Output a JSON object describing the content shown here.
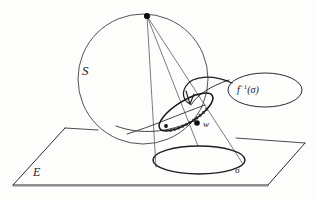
{
  "figure": {
    "stroke_color": "#2a2a2a",
    "fill_color": "#111111",
    "background_color": "#fdfdfc"
  },
  "labels": {
    "sphere": "S",
    "plane": "E",
    "point_w": "w",
    "image_curve": "σ",
    "preimage_curve_f": "f",
    "preimage_curve_exp": "−1",
    "preimage_curve_arg": "(σ)",
    "preimage_curve_full": "f⁻¹(σ)"
  },
  "geometry": {
    "sphere": {
      "cx": 143,
      "cy": 79,
      "r": 65
    },
    "apex_point": {
      "x": 147,
      "y": 16,
      "r": 3.1
    },
    "point_w": {
      "x": 197,
      "y": 123,
      "r": 2.8
    },
    "sigma_ellipse": {
      "cx": 199,
      "cy": 160,
      "rx": 46,
      "ry": 14
    },
    "preimage_ellipse": {
      "cx": 186,
      "cy": 112,
      "rx": 31,
      "ry": 11,
      "rotation": -32
    },
    "callout_ellipse": {
      "cx": 265,
      "cy": 90,
      "rx": 37,
      "ry": 17
    },
    "plane_corners": [
      {
        "x": 13,
        "y": 185
      },
      {
        "x": 65,
        "y": 128
      },
      {
        "x": 305,
        "y": 143
      },
      {
        "x": 268,
        "y": 185
      }
    ],
    "cone_lines": [
      {
        "x1": 147,
        "y1": 16,
        "x2": 156,
        "y2": 167
      },
      {
        "x1": 147,
        "y1": 16,
        "x2": 198,
        "y2": 146
      },
      {
        "x1": 147,
        "y1": 16,
        "x2": 243,
        "y2": 164
      }
    ],
    "tangent_line": {
      "x1": 127,
      "y1": 133,
      "x2": 205,
      "y2": 106
    }
  }
}
